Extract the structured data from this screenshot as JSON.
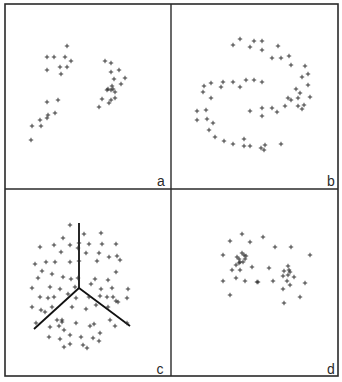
{
  "figure": {
    "background": "#ffffff",
    "ink": "#2a2a2a",
    "border": {
      "x1": 5,
      "y1": 4,
      "x2": 338,
      "y2": 376
    },
    "dividers": {
      "x": 171,
      "y": 189
    }
  },
  "chart_data": [
    {
      "type": "scatter",
      "panel": "a",
      "label": "a",
      "label_pos": [
        161,
        186
      ],
      "marker": "+",
      "title": "",
      "xlabel": "",
      "ylabel": "",
      "points": [
        [
          67,
          46
        ],
        [
          47,
          57
        ],
        [
          54,
          57
        ],
        [
          65,
          57
        ],
        [
          71,
          61
        ],
        [
          47,
          70
        ],
        [
          60,
          67
        ],
        [
          67,
          67
        ],
        [
          61,
          74
        ],
        [
          47,
          102
        ],
        [
          58,
          100
        ],
        [
          48,
          115
        ],
        [
          55,
          113
        ],
        [
          41,
          126
        ],
        [
          40,
          120
        ],
        [
          47,
          118
        ],
        [
          31,
          140
        ],
        [
          32,
          126
        ],
        [
          105,
          61
        ],
        [
          111,
          63
        ],
        [
          111,
          72
        ],
        [
          119,
          70
        ],
        [
          114,
          79
        ],
        [
          125,
          78
        ],
        [
          112,
          86
        ],
        [
          108,
          89
        ],
        [
          113,
          89
        ],
        [
          121,
          84
        ],
        [
          107,
          90
        ],
        [
          111,
          90
        ],
        [
          115,
          92
        ],
        [
          102,
          99
        ],
        [
          111,
          100
        ],
        [
          115,
          98
        ],
        [
          99,
          107
        ],
        [
          109,
          103
        ]
      ]
    },
    {
      "type": "scatter",
      "panel": "b",
      "label": "b",
      "label_pos": [
        331,
        186
      ],
      "marker": "+",
      "title": "",
      "xlabel": "",
      "ylabel": "",
      "points": [
        [
          240,
          39
        ],
        [
          233,
          45
        ],
        [
          254,
          41
        ],
        [
          262,
          41
        ],
        [
          250,
          47
        ],
        [
          262,
          50
        ],
        [
          278,
          46
        ],
        [
          272,
          58
        ],
        [
          281,
          58
        ],
        [
          289,
          56
        ],
        [
          291,
          65
        ],
        [
          305,
          66
        ],
        [
          302,
          77
        ],
        [
          308,
          74
        ],
        [
          308,
          85
        ],
        [
          296,
          89
        ],
        [
          211,
          83
        ],
        [
          223,
          82
        ],
        [
          233,
          82
        ],
        [
          246,
          80
        ],
        [
          254,
          80
        ],
        [
          262,
          82
        ],
        [
          204,
          86
        ],
        [
          221,
          87
        ],
        [
          240,
          87
        ],
        [
          203,
          92
        ],
        [
          211,
          98
        ],
        [
          197,
          111
        ],
        [
          206,
          110
        ],
        [
          197,
          120
        ],
        [
          207,
          119
        ],
        [
          213,
          123
        ],
        [
          209,
          130
        ],
        [
          215,
          137
        ],
        [
          224,
          141
        ],
        [
          233,
          144
        ],
        [
          244,
          139
        ],
        [
          244,
          146
        ],
        [
          250,
          146
        ],
        [
          261,
          148
        ],
        [
          265,
          145
        ],
        [
          281,
          144
        ],
        [
          264,
          150
        ],
        [
          250,
          111
        ],
        [
          262,
          108
        ],
        [
          262,
          116
        ],
        [
          272,
          108
        ],
        [
          277,
          112
        ],
        [
          285,
          106
        ],
        [
          288,
          98
        ],
        [
          291,
          100
        ],
        [
          298,
          98
        ],
        [
          300,
          93
        ],
        [
          304,
          105
        ],
        [
          302,
          109
        ],
        [
          310,
          97
        ],
        [
          298,
          106
        ]
      ]
    },
    {
      "type": "scatter",
      "panel": "c",
      "label": "c",
      "label_pos": [
        160,
        374
      ],
      "marker": "+",
      "title": "",
      "xlabel": "",
      "ylabel": "",
      "lines": [
        {
          "x1": 79,
          "y1": 223,
          "x2": 79,
          "y2": 288
        },
        {
          "x1": 79,
          "y1": 288,
          "x2": 34,
          "y2": 329
        },
        {
          "x1": 79,
          "y1": 288,
          "x2": 130,
          "y2": 326
        }
      ],
      "points": [
        [
          70,
          225
        ],
        [
          84,
          234
        ],
        [
          101,
          233
        ],
        [
          63,
          238
        ],
        [
          40,
          247
        ],
        [
          54,
          245
        ],
        [
          70,
          245
        ],
        [
          79,
          243
        ],
        [
          89,
          244
        ],
        [
          102,
          244
        ],
        [
          116,
          244
        ],
        [
          61,
          252
        ],
        [
          78,
          248
        ],
        [
          86,
          253
        ],
        [
          99,
          253
        ],
        [
          117,
          256
        ],
        [
          35,
          264
        ],
        [
          46,
          262
        ],
        [
          55,
          262
        ],
        [
          70,
          262
        ],
        [
          79,
          261
        ],
        [
          97,
          261
        ],
        [
          109,
          257
        ],
        [
          120,
          260
        ],
        [
          38,
          278
        ],
        [
          42,
          271
        ],
        [
          52,
          274
        ],
        [
          63,
          277
        ],
        [
          71,
          279
        ],
        [
          78,
          278
        ],
        [
          95,
          279
        ],
        [
          108,
          280
        ],
        [
          116,
          272
        ],
        [
          32,
          288
        ],
        [
          50,
          287
        ],
        [
          60,
          289
        ],
        [
          75,
          287
        ],
        [
          91,
          284
        ],
        [
          101,
          289
        ],
        [
          112,
          288
        ],
        [
          128,
          289
        ],
        [
          40,
          297
        ],
        [
          48,
          298
        ],
        [
          54,
          297
        ],
        [
          68,
          294
        ],
        [
          76,
          298
        ],
        [
          89,
          297
        ],
        [
          100,
          296
        ],
        [
          107,
          297
        ],
        [
          113,
          297
        ],
        [
          127,
          298
        ],
        [
          118,
          302
        ],
        [
          32,
          307
        ],
        [
          41,
          310
        ],
        [
          45,
          312
        ],
        [
          52,
          307
        ],
        [
          72,
          307
        ],
        [
          86,
          309
        ],
        [
          96,
          305
        ],
        [
          108,
          307
        ],
        [
          116,
          301
        ],
        [
          36,
          323
        ],
        [
          57,
          320
        ],
        [
          62,
          322
        ],
        [
          62,
          320
        ],
        [
          76,
          323
        ],
        [
          94,
          324
        ],
        [
          110,
          320
        ],
        [
          127,
          323
        ],
        [
          50,
          327
        ],
        [
          59,
          326
        ],
        [
          64,
          330
        ],
        [
          90,
          326
        ],
        [
          100,
          333
        ],
        [
          115,
          326
        ],
        [
          49,
          337
        ],
        [
          60,
          339
        ],
        [
          70,
          335
        ],
        [
          81,
          337
        ],
        [
          93,
          338
        ],
        [
          64,
          347
        ],
        [
          70,
          344
        ],
        [
          83,
          345
        ],
        [
          99,
          341
        ],
        [
          87,
          348
        ]
      ]
    },
    {
      "type": "scatter",
      "panel": "d",
      "label": "d",
      "label_pos": [
        331,
        374
      ],
      "marker": "+",
      "title": "",
      "xlabel": "",
      "ylabel": "",
      "points": [
        [
          242,
          234
        ],
        [
          230,
          241
        ],
        [
          250,
          242
        ],
        [
          263,
          237
        ],
        [
          275,
          247
        ],
        [
          291,
          247
        ],
        [
          223,
          255
        ],
        [
          242,
          253
        ],
        [
          244,
          255
        ],
        [
          246,
          256
        ],
        [
          237,
          257
        ],
        [
          239,
          259
        ],
        [
          245,
          259
        ],
        [
          240,
          262
        ],
        [
          243,
          262
        ],
        [
          236,
          265
        ],
        [
          239,
          263
        ],
        [
          232,
          270
        ],
        [
          240,
          270
        ],
        [
          223,
          281
        ],
        [
          236,
          278
        ],
        [
          245,
          281
        ],
        [
          257,
          282
        ],
        [
          258,
          282
        ],
        [
          269,
          268
        ],
        [
          252,
          267
        ],
        [
          273,
          281
        ],
        [
          288,
          266
        ],
        [
          284,
          271
        ],
        [
          289,
          270
        ],
        [
          290,
          272
        ],
        [
          288,
          275
        ],
        [
          294,
          277
        ],
        [
          283,
          276
        ],
        [
          287,
          281
        ],
        [
          290,
          285
        ],
        [
          305,
          283
        ],
        [
          283,
          289
        ],
        [
          300,
          297
        ],
        [
          284,
          303
        ],
        [
          230,
          295
        ],
        [
          310,
          255
        ]
      ]
    }
  ]
}
